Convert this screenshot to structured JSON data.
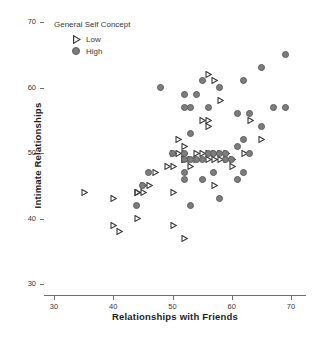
{
  "chart_data": {
    "type": "scatter",
    "title": "",
    "xlabel": "Relationships with Friends",
    "ylabel": "Intimate Relationships",
    "xlim": [
      28,
      72
    ],
    "ylim": [
      28,
      72
    ],
    "xticks": [
      30,
      40,
      50,
      60,
      70
    ],
    "yticks": [
      30,
      40,
      50,
      60,
      70
    ],
    "grid": false,
    "legend": {
      "title": "General Self Concept",
      "position": "top-left",
      "entries": [
        {
          "name": "Low",
          "marker": "triangle-right-open",
          "color": "#3a3a3a"
        },
        {
          "name": "High",
          "marker": "circle-filled",
          "color": "#7d7d7d"
        }
      ]
    },
    "series": [
      {
        "name": "Low",
        "marker": "triangle-right-open",
        "color": "#3a3a3a",
        "points": [
          [
            35,
            44
          ],
          [
            40,
            43
          ],
          [
            40,
            39
          ],
          [
            41,
            38
          ],
          [
            44,
            44
          ],
          [
            44,
            44
          ],
          [
            44,
            40
          ],
          [
            45,
            44
          ],
          [
            45,
            45
          ],
          [
            46,
            45
          ],
          [
            47,
            47
          ],
          [
            49,
            48
          ],
          [
            50,
            44
          ],
          [
            50,
            50
          ],
          [
            50,
            48
          ],
          [
            50,
            39
          ],
          [
            51,
            52
          ],
          [
            51,
            50
          ],
          [
            52,
            51
          ],
          [
            52,
            49
          ],
          [
            52,
            50
          ],
          [
            52,
            49
          ],
          [
            52,
            37
          ],
          [
            53,
            49
          ],
          [
            53,
            48
          ],
          [
            54,
            50
          ],
          [
            54,
            49
          ],
          [
            55,
            55
          ],
          [
            55,
            50
          ],
          [
            56,
            62
          ],
          [
            56,
            55
          ],
          [
            56,
            54
          ],
          [
            56,
            50
          ],
          [
            56,
            49
          ],
          [
            57,
            61
          ],
          [
            57,
            50
          ],
          [
            57,
            49
          ],
          [
            57,
            45
          ],
          [
            58,
            58
          ],
          [
            58,
            50
          ],
          [
            58,
            49
          ],
          [
            59,
            50
          ],
          [
            59,
            49
          ],
          [
            60,
            49
          ],
          [
            60,
            48
          ],
          [
            62,
            50
          ],
          [
            63,
            55
          ],
          [
            65,
            52
          ]
        ]
      },
      {
        "name": "High",
        "marker": "circle-filled",
        "color": "#7d7d7d",
        "points": [
          [
            44,
            42
          ],
          [
            45,
            45
          ],
          [
            46,
            47
          ],
          [
            48,
            60
          ],
          [
            50,
            50
          ],
          [
            52,
            59
          ],
          [
            52,
            57
          ],
          [
            52,
            50
          ],
          [
            52,
            49
          ],
          [
            52,
            47
          ],
          [
            52,
            46
          ],
          [
            53,
            57
          ],
          [
            53,
            53
          ],
          [
            53,
            49
          ],
          [
            53,
            42
          ],
          [
            54,
            59
          ],
          [
            54,
            49
          ],
          [
            55,
            61
          ],
          [
            55,
            49
          ],
          [
            55,
            46
          ],
          [
            56,
            57
          ],
          [
            56,
            50
          ],
          [
            57,
            50
          ],
          [
            57,
            47
          ],
          [
            58,
            60
          ],
          [
            58,
            50
          ],
          [
            58,
            43
          ],
          [
            59,
            50
          ],
          [
            59,
            49
          ],
          [
            60,
            49
          ],
          [
            61,
            56
          ],
          [
            61,
            51
          ],
          [
            61,
            46
          ],
          [
            62,
            61
          ],
          [
            62,
            52
          ],
          [
            62,
            47
          ],
          [
            63,
            56
          ],
          [
            63,
            50
          ],
          [
            65,
            63
          ],
          [
            65,
            54
          ],
          [
            67,
            57
          ],
          [
            69,
            65
          ],
          [
            69,
            57
          ]
        ]
      }
    ]
  },
  "figure": {
    "caption_sliver": ""
  }
}
